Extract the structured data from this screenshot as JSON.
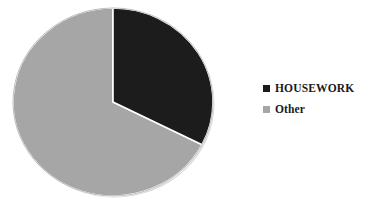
{
  "chart_data": {
    "type": "pie",
    "title": "",
    "subtitle": "",
    "xlabel": "",
    "ylabel": "",
    "grid": false,
    "legend_position": "right",
    "categories": [
      "HOUSEWORK",
      "Other"
    ],
    "values": [
      32.5,
      67.5
    ],
    "units": "percent",
    "start_angle_deg": 0,
    "direction": "clockwise",
    "slices": [
      {
        "label": "HOUSEWORK",
        "value": 32.5,
        "color": "#1c1c1c",
        "start_angle_deg": 0,
        "end_angle_deg": 117
      },
      {
        "label": "Other",
        "value": 67.5,
        "color": "#a6a6a6",
        "start_angle_deg": 117,
        "end_angle_deg": 360
      }
    ],
    "data_labels_visible": false
  },
  "legend": {
    "items": [
      {
        "label": "HOUSEWORK",
        "color": "#1c1c1c",
        "marker": "square-marker"
      },
      {
        "label": "Other",
        "color": "#a6a6a6",
        "marker": "square-marker"
      }
    ]
  },
  "colors": {
    "background": "#ffffff",
    "housework": "#1c1c1c",
    "other": "#a6a6a6",
    "slice_divider": "#ffffff",
    "pie_outline": "#bdbdbd",
    "text": "#1a1a1a"
  },
  "geometry": {
    "center_x": 113,
    "center_y": 102,
    "radius_x": 100,
    "radius_y": 94
  }
}
